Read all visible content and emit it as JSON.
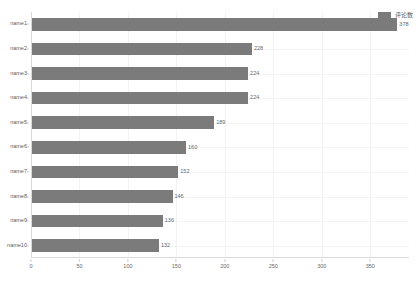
{
  "legend": {
    "swatch_color": "#7b7b7b",
    "label": "评论数"
  },
  "axis": {
    "x_ticks": [
      "0",
      "50",
      "100",
      "150",
      "200",
      "250",
      "300",
      "350"
    ]
  },
  "chart_data": {
    "type": "bar",
    "orientation": "horizontal",
    "title": "",
    "xlabel": "",
    "ylabel": "",
    "xlim": [
      0,
      390
    ],
    "grid": true,
    "legend_position": "top-right",
    "series_name": "评论数",
    "bar_color": "#7b7b7b",
    "categories": [
      "name1",
      "name2",
      "name3",
      "name4",
      "name5",
      "name6",
      "name7",
      "name8",
      "name9",
      "name10"
    ],
    "values": [
      378,
      228,
      224,
      224,
      189,
      160,
      152,
      146,
      136,
      132
    ],
    "value_labels": [
      "378",
      "228",
      "224",
      "224",
      "189",
      "160",
      "152",
      "146",
      "136",
      "132"
    ],
    "x_tick_values": [
      0,
      50,
      100,
      150,
      200,
      250,
      300,
      350
    ]
  }
}
